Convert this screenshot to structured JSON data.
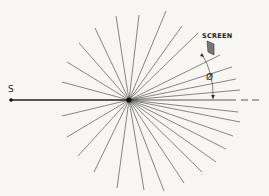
{
  "diagram": {
    "source_label": "S",
    "screen_label": "SCREEN",
    "angle_label": "Ø",
    "center": [
      129,
      100
    ],
    "colors": {
      "ray": "#555555",
      "axis": "#222222",
      "screen_fill": "#777777",
      "background": "#f7f6f3"
    },
    "rays": [
      [
        62,
        82
      ],
      [
        67,
        62
      ],
      [
        79,
        43
      ],
      [
        95,
        28
      ],
      [
        116,
        16
      ],
      [
        139,
        15
      ],
      [
        166,
        11
      ],
      [
        182,
        26
      ],
      [
        198,
        33
      ],
      [
        220,
        55
      ],
      [
        232,
        67
      ],
      [
        236,
        79
      ],
      [
        240,
        90
      ],
      [
        238,
        112
      ],
      [
        240,
        122
      ],
      [
        233,
        136
      ],
      [
        226,
        149
      ],
      [
        216,
        162
      ],
      [
        202,
        172
      ],
      [
        184,
        183
      ],
      [
        164,
        191
      ],
      [
        144,
        190
      ],
      [
        117,
        188
      ],
      [
        94,
        172
      ],
      [
        78,
        156
      ],
      [
        67,
        137
      ],
      [
        62,
        116
      ]
    ]
  }
}
